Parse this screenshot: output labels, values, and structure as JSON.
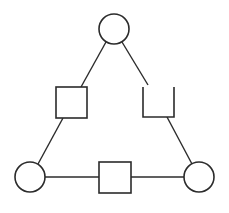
{
  "diagram": {
    "type": "triangle-network",
    "canvas": {
      "width": 229,
      "height": 213,
      "background": "#ffffff"
    },
    "stroke_color": "#2b2b2b",
    "nodes": [
      {
        "id": "top-circle",
        "shape": "circle",
        "cx": 114,
        "cy": 29,
        "r": 15
      },
      {
        "id": "left-square",
        "shape": "square",
        "x": 56,
        "y": 87,
        "w": 31,
        "h": 31
      },
      {
        "id": "right-open-box",
        "shape": "open-box",
        "x": 143,
        "y": 87,
        "w": 31,
        "h": 30
      },
      {
        "id": "bottom-left-circle",
        "shape": "circle",
        "cx": 30,
        "cy": 177,
        "r": 15
      },
      {
        "id": "bottom-square",
        "shape": "square",
        "x": 99,
        "y": 162,
        "w": 32,
        "h": 31
      },
      {
        "id": "bottom-right-circle",
        "shape": "circle",
        "cx": 199,
        "cy": 177,
        "r": 15
      }
    ],
    "edges": [
      {
        "id": "top-to-left-square",
        "x1": 106,
        "y1": 42,
        "x2": 81,
        "y2": 87
      },
      {
        "id": "left-square-to-bottom-left",
        "x1": 63,
        "y1": 118,
        "x2": 38,
        "y2": 164
      },
      {
        "id": "top-to-right-box",
        "x1": 122,
        "y1": 42,
        "x2": 148,
        "y2": 85
      },
      {
        "id": "right-box-to-bottom-right",
        "x1": 167,
        "y1": 117,
        "x2": 192,
        "y2": 164
      },
      {
        "id": "bottom-left-to-bottom-square",
        "x1": 45,
        "y1": 177,
        "x2": 99,
        "y2": 177
      },
      {
        "id": "bottom-square-to-bottom-right",
        "x1": 131,
        "y1": 177,
        "x2": 184,
        "y2": 177
      }
    ]
  }
}
